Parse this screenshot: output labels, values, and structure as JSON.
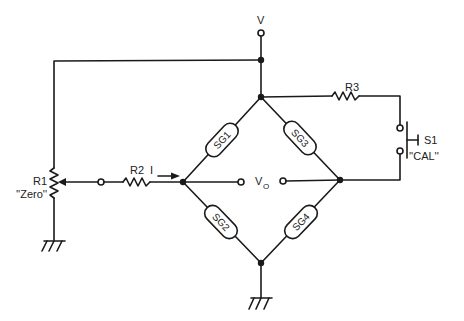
{
  "diagram": {
    "type": "Wheatstone bridge strain gauge circuit",
    "supply": {
      "label": "V"
    },
    "output": {
      "label": "V",
      "subscript": "O"
    },
    "gauges": [
      {
        "id": "SG1",
        "label": "SG1"
      },
      {
        "id": "SG2",
        "label": "SG2"
      },
      {
        "id": "SG3",
        "label": "SG3"
      },
      {
        "id": "SG4",
        "label": "SG4"
      }
    ],
    "resistors": {
      "r1": {
        "label": "R1",
        "note": "''Zero''"
      },
      "r2": {
        "label": "R2"
      },
      "r3": {
        "label": "R3"
      }
    },
    "current": {
      "label": "I"
    },
    "switch": {
      "label": "S1",
      "note": "''CAL''"
    },
    "colors": {
      "line": "#1a1a1a",
      "background": "#ffffff"
    }
  }
}
